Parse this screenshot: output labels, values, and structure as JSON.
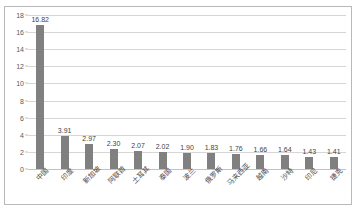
{
  "chart_data": {
    "type": "bar",
    "title": "",
    "subtitle": "",
    "xlabel": "",
    "ylabel": "",
    "ylim": [
      0,
      18
    ],
    "ytick_step": 2,
    "yticks": [
      18,
      16,
      14,
      12,
      10,
      8,
      6,
      4,
      2,
      0
    ],
    "grid": true,
    "legend": false,
    "legend_position": "none",
    "bar_color": "#808080",
    "gridline_color": "#d6d6d6",
    "categories": [
      "中国",
      "印度",
      "新加坡",
      "阿联酋",
      "土耳其",
      "泰国",
      "波兰",
      "俄罗斯",
      "马来西亚",
      "越南",
      "沙特",
      "印尼",
      "捷克"
    ],
    "values": [
      16.82,
      3.91,
      2.97,
      2.3,
      2.07,
      2.02,
      1.9,
      1.83,
      1.76,
      1.66,
      1.64,
      1.43,
      1.41
    ],
    "value_labels": [
      "16.82",
      "3.91",
      "2.97",
      "2.30",
      "2.07",
      "2.02",
      "1.90",
      "1.83",
      "1.76",
      "1.66",
      "1.64",
      "1.43",
      "1.41"
    ]
  }
}
